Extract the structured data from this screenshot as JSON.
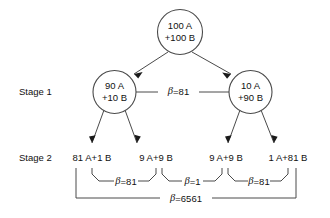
{
  "diagram": {
    "stage_labels": [
      {
        "id": "stage-1",
        "text": "Stage 1"
      },
      {
        "id": "stage-2",
        "text": "Stage 2"
      }
    ],
    "root_node": {
      "line1": "100 A",
      "line2": "+100 B"
    },
    "stage1_nodes": [
      {
        "line1": "90 A",
        "line2": "+10 B"
      },
      {
        "line1": "10 A",
        "line2": "+90 B"
      }
    ],
    "stage1_link_label": "β=81",
    "stage1_link_beta_symbol": "β",
    "stage1_link_beta_value": "=81",
    "stage2_leaves": [
      {
        "text": "81 A+1 B"
      },
      {
        "text": "9 A+9 B"
      },
      {
        "text": "9 A+9 B"
      },
      {
        "text": "1 A+81 B"
      }
    ],
    "inner_braces": [
      {
        "symbol": "β",
        "value": "=81"
      },
      {
        "symbol": "β",
        "value": "=1"
      },
      {
        "symbol": "β",
        "value": "=81"
      }
    ],
    "outer_brace": {
      "symbol": "β",
      "value": "=6561"
    },
    "colors": {
      "stroke": "#4a4a4a",
      "text": "#111111",
      "background": "#ffffff"
    }
  }
}
